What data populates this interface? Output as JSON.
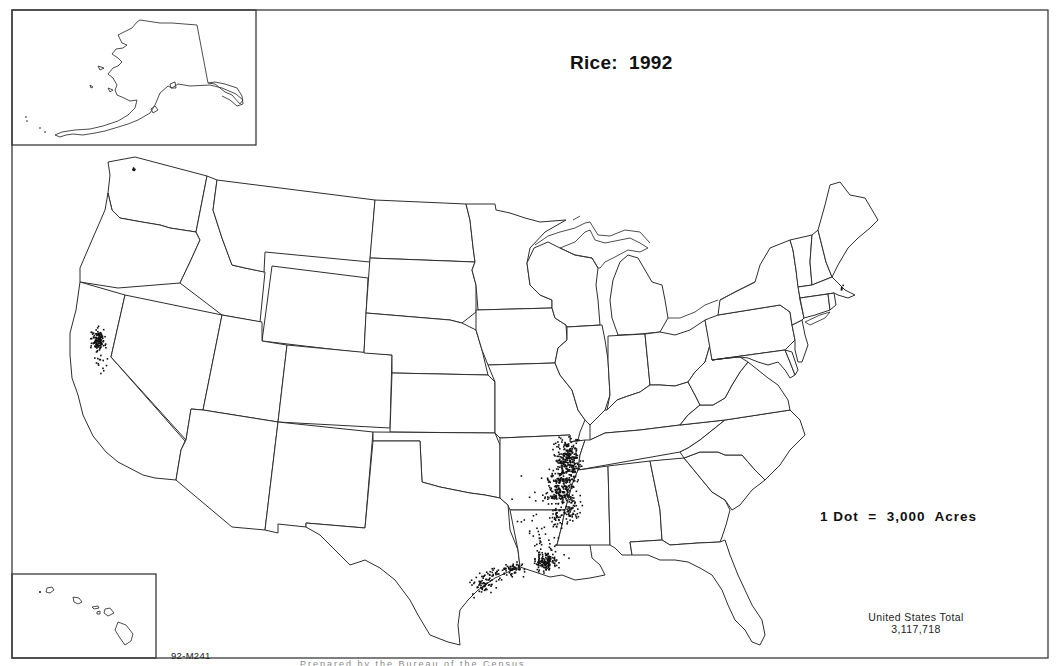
{
  "map": {
    "title": "Rice:  1992",
    "legend": "1 Dot  =  3,000  Acres",
    "total_label": "United States Total",
    "total_value": "3,117,718",
    "map_code": "92-M241",
    "footer_text": "Prepared by the Bureau of the Census",
    "insets": [
      "Alaska",
      "Hawaii"
    ],
    "colors": {
      "outline": "#2e2e2e",
      "dot": "#111111",
      "background": "#ffffff"
    }
  },
  "chart_data": {
    "type": "dot-density map",
    "title": "Rice: 1992",
    "unit": "1 dot = 3,000 acres",
    "total_acres": 3117718,
    "concentrations": [
      {
        "region": "Arkansas (eastern / Mississippi delta)",
        "density": "very high"
      },
      {
        "region": "Louisiana (southwest)",
        "density": "high"
      },
      {
        "region": "California (Sacramento Valley)",
        "density": "high"
      },
      {
        "region": "Mississippi (delta)",
        "density": "moderate"
      },
      {
        "region": "Missouri (bootheel)",
        "density": "moderate"
      },
      {
        "region": "Texas (upper Gulf Coast)",
        "density": "moderate"
      }
    ],
    "dot_clusters": [
      {
        "cx": 97,
        "cy": 340,
        "rx": 6,
        "ry": 10,
        "n": 130,
        "seed": 11
      },
      {
        "cx": 100,
        "cy": 362,
        "rx": 6,
        "ry": 10,
        "n": 14,
        "seed": 12
      },
      {
        "cx": 567,
        "cy": 458,
        "rx": 11,
        "ry": 18,
        "n": 260,
        "seed": 21
      },
      {
        "cx": 560,
        "cy": 488,
        "rx": 13,
        "ry": 16,
        "n": 230,
        "seed": 22
      },
      {
        "cx": 570,
        "cy": 510,
        "rx": 9,
        "ry": 12,
        "n": 60,
        "seed": 23
      },
      {
        "cx": 556,
        "cy": 517,
        "rx": 6,
        "ry": 8,
        "n": 30,
        "seed": 24
      },
      {
        "cx": 544,
        "cy": 562,
        "rx": 10,
        "ry": 8,
        "n": 140,
        "seed": 31
      },
      {
        "cx": 548,
        "cy": 545,
        "rx": 16,
        "ry": 16,
        "n": 40,
        "seed": 32
      },
      {
        "cx": 512,
        "cy": 568,
        "rx": 10,
        "ry": 7,
        "n": 55,
        "seed": 41
      },
      {
        "cx": 482,
        "cy": 583,
        "rx": 12,
        "ry": 10,
        "n": 65,
        "seed": 42
      },
      {
        "cx": 496,
        "cy": 573,
        "rx": 8,
        "ry": 6,
        "n": 25,
        "seed": 43
      },
      {
        "cx": 527,
        "cy": 500,
        "rx": 18,
        "ry": 30,
        "n": 14,
        "seed": 51
      },
      {
        "cx": 133,
        "cy": 167,
        "rx": 1.5,
        "ry": 4,
        "n": 6,
        "seed": 61
      },
      {
        "cx": 841,
        "cy": 288,
        "rx": 2,
        "ry": 3,
        "n": 5,
        "seed": 62
      }
    ]
  }
}
